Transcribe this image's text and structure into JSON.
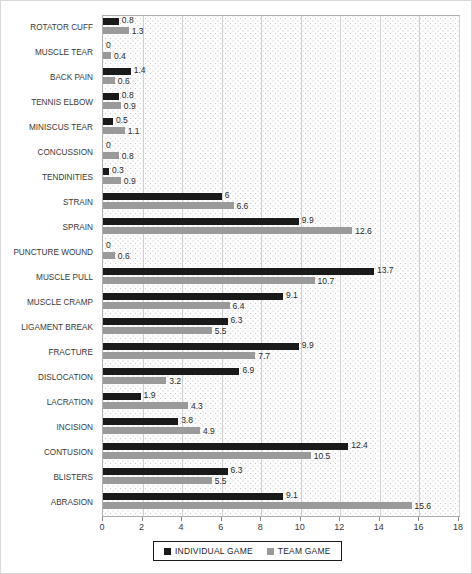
{
  "chart_data": {
    "type": "bar",
    "orientation": "horizontal",
    "title": "",
    "xlabel": "",
    "ylabel": "",
    "xlim": [
      0,
      18
    ],
    "xticks": [
      0,
      2,
      4,
      6,
      8,
      10,
      12,
      14,
      16,
      18
    ],
    "grid": true,
    "legend_position": "bottom",
    "categories": [
      "ROTATOR CUFF",
      "MUSCLE TEAR",
      "BACK PAIN",
      "TENNIS ELBOW",
      "MINISCUS TEAR",
      "CONCUSSION",
      "TENDINITIES",
      "STRAIN",
      "SPRAIN",
      "PUNCTURE WOUND",
      "MUSCLE PULL",
      "MUSCLE CRAMP",
      "LIGAMENT BREAK",
      "FRACTURE",
      "DISLOCATION",
      "LACRATION",
      "INCISION",
      "CONTUSION",
      "BLISTERS",
      "ABRASION"
    ],
    "series": [
      {
        "name": "INDIVIDUAL GAME",
        "color": "#1a1a1a",
        "values": [
          0.8,
          0,
          1.4,
          0.8,
          0.5,
          0,
          0.3,
          6,
          9.9,
          0,
          13.7,
          9.1,
          6.3,
          9.9,
          6.9,
          1.9,
          3.8,
          12.4,
          6.3,
          9.1
        ],
        "labels": [
          "0.8",
          "0",
          "1.4",
          "0.8",
          "0.5",
          "0",
          "0.3",
          "6",
          "9.9",
          "0",
          "13.7",
          "9.1",
          "6.3",
          "9.9",
          "6.9",
          "1.9",
          "3.8",
          "12.4",
          "6.3",
          "9.1"
        ]
      },
      {
        "name": "TEAM GAME",
        "color": "#9a9a9a",
        "values": [
          1.3,
          0.4,
          0.6,
          0.9,
          1.1,
          0.8,
          0.9,
          6.6,
          12.6,
          0.6,
          10.7,
          6.4,
          5.5,
          7.7,
          3.2,
          4.3,
          4.9,
          10.5,
          5.5,
          15.6
        ],
        "labels": [
          "1.3",
          "0.4",
          "0.6",
          "0.9",
          "1.1",
          "0.8",
          "0.9",
          "6.6",
          "12.6",
          "0.6",
          "10.7",
          "6.4",
          "5.5",
          "7.7",
          "3.2",
          "4.3",
          "4.9",
          "10.5",
          "5.5",
          "15.6"
        ]
      }
    ]
  },
  "legend": {
    "items": [
      {
        "label": "INDIVIDUAL GAME",
        "color": "#1a1a1a"
      },
      {
        "label": "TEAM GAME",
        "color": "#9a9a9a"
      }
    ]
  }
}
